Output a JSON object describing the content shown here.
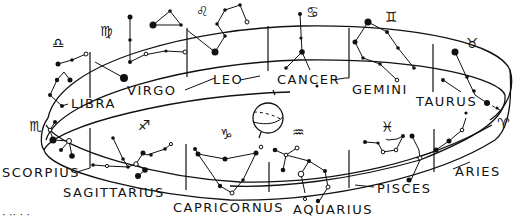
{
  "figure": {
    "center_object": "earth-globe"
  },
  "constellations": [
    {
      "name": "ARIES",
      "symbol": "♈"
    },
    {
      "name": "TAURUS",
      "symbol": "♉"
    },
    {
      "name": "GEMINI",
      "symbol": "♊"
    },
    {
      "name": "CANCER",
      "symbol": "♋"
    },
    {
      "name": "LEO",
      "symbol": "♌"
    },
    {
      "name": "VIRGO",
      "symbol": "♍"
    },
    {
      "name": "LIBRA",
      "symbol": "♎"
    },
    {
      "name": "SCORPIUS",
      "symbol": "♏"
    },
    {
      "name": "SAGITTARIUS",
      "symbol": "♐"
    },
    {
      "name": "CAPRICORNUS",
      "symbol": "♑"
    },
    {
      "name": "AQUARIUS",
      "symbol": "♒"
    },
    {
      "name": "PISCES",
      "symbol": "♓"
    }
  ],
  "caption_fragment": "· ·· · ·"
}
